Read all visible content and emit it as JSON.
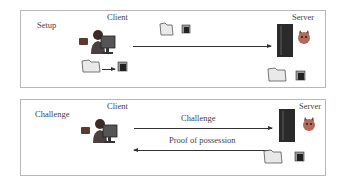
{
  "panels": [
    {
      "id": "setup",
      "phase_label": "Setup",
      "client_label": "Client",
      "server_label": "Server",
      "flows": [
        {
          "direction": "client-to-server",
          "label": "",
          "payload_icons": [
            "file-folder-icon",
            "tagged-file-icon"
          ]
        }
      ],
      "client_side_process": {
        "from": "file-folder-icon",
        "to": "tagged-file-icon"
      },
      "server_side_stored": [
        "file-folder-icon",
        "tagged-file-icon"
      ]
    },
    {
      "id": "challenge",
      "phase_label": "Challenge",
      "client_label": "Client",
      "server_label": "Server",
      "flows": [
        {
          "direction": "client-to-server",
          "label": "Challenge"
        },
        {
          "direction": "server-to-client",
          "label": "Proof of possession"
        }
      ],
      "server_side_stored": [
        "file-folder-icon",
        "tagged-file-icon"
      ]
    }
  ],
  "colors": {
    "border": "#b8b8b8",
    "arrow": "#333333",
    "server": "#2a2a2a",
    "devil": "#c06060"
  }
}
